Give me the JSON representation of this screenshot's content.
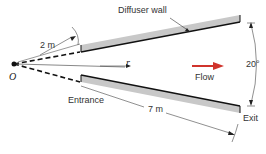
{
  "diagram": {
    "type": "diffuser-geometry",
    "labels": {
      "wall": "Diffuser wall",
      "origin": "O",
      "entrance_distance": "2 m",
      "radius": "r",
      "flow": "Flow",
      "angle": "20°",
      "entrance": "Entrance",
      "wall_length": "7 m",
      "exit": "Exit"
    },
    "colors": {
      "wall_fill": "#c8c8c8",
      "wall_edge": "#111111",
      "flow_arrow": "#d0342c",
      "lines": "#333333"
    }
  }
}
